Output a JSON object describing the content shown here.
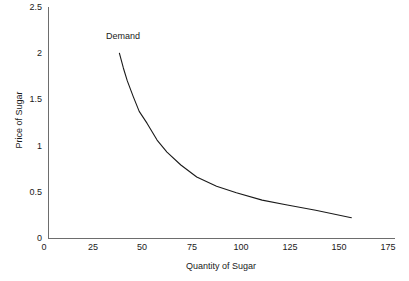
{
  "chart_data": {
    "type": "line",
    "title": "",
    "xlabel": "Quantity of Sugar",
    "ylabel": "Price of Sugar",
    "xlim": [
      0,
      175
    ],
    "ylim": [
      0,
      2.5
    ],
    "grid": false,
    "legend_position": "none",
    "xticks": [
      "0",
      "25",
      "50",
      "75",
      "100",
      "125",
      "150",
      "175"
    ],
    "xtick_values": [
      0,
      25,
      50,
      75,
      100,
      125,
      150,
      175
    ],
    "yticks": [
      "0",
      "0.5",
      "1",
      "1.5",
      "2",
      "2.5"
    ],
    "ytick_values": [
      0,
      0.5,
      1,
      1.5,
      2,
      2.5
    ],
    "series": [
      {
        "name": "Demand",
        "color": "#1a1a1a",
        "annotation": "Demand",
        "x": [
          36,
          38,
          40,
          43,
          46,
          50,
          55,
          60,
          67,
          75,
          85,
          95,
          108,
          120,
          135,
          153
        ],
        "y": [
          2.0,
          1.84,
          1.7,
          1.53,
          1.37,
          1.24,
          1.06,
          0.93,
          0.79,
          0.66,
          0.56,
          0.49,
          0.41,
          0.36,
          0.3,
          0.22
        ]
      }
    ]
  },
  "axes": {
    "y_title": "Price of Sugar",
    "x_title": "Quantity of Sugar"
  },
  "annotations": {
    "demand": "Demand"
  },
  "colors": {
    "curve": "#1a1a1a",
    "axis": "#6d6d6d",
    "text": "#1a1a1a",
    "background": "#ffffff"
  }
}
